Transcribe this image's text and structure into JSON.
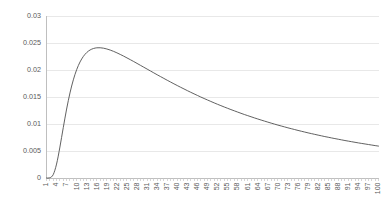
{
  "chart_data": {
    "type": "line",
    "title": "",
    "subtitle": "",
    "xlabel": "",
    "ylabel": "",
    "xlim": [
      1,
      100
    ],
    "ylim": [
      0,
      0.03
    ],
    "grid": true,
    "legend": null,
    "legend_position": "none",
    "series_color": "#4f4f4f",
    "grid_color": "#e2e2e2",
    "axis_color": "#b8b8b8",
    "tick_label_color": "#5a5a5a",
    "y_ticks": [
      {
        "value": 0,
        "label": "0"
      },
      {
        "value": 0.005,
        "label": "0.005"
      },
      {
        "value": 0.01,
        "label": "0.01"
      },
      {
        "value": 0.015,
        "label": "0.015"
      },
      {
        "value": 0.02,
        "label": "0.02"
      },
      {
        "value": 0.025,
        "label": "0.025"
      },
      {
        "value": 0.03,
        "label": "0.03"
      }
    ],
    "x_ticks": [
      {
        "value": 1,
        "label": "1"
      },
      {
        "value": 4,
        "label": "4"
      },
      {
        "value": 7,
        "label": "7"
      },
      {
        "value": 10,
        "label": "10"
      },
      {
        "value": 13,
        "label": "13"
      },
      {
        "value": 16,
        "label": "16"
      },
      {
        "value": 19,
        "label": "19"
      },
      {
        "value": 22,
        "label": "22"
      },
      {
        "value": 25,
        "label": "25"
      },
      {
        "value": 28,
        "label": "28"
      },
      {
        "value": 31,
        "label": "31"
      },
      {
        "value": 34,
        "label": "34"
      },
      {
        "value": 37,
        "label": "37"
      },
      {
        "value": 40,
        "label": "40"
      },
      {
        "value": 43,
        "label": "43"
      },
      {
        "value": 46,
        "label": "46"
      },
      {
        "value": 49,
        "label": "49"
      },
      {
        "value": 52,
        "label": "52"
      },
      {
        "value": 55,
        "label": "55"
      },
      {
        "value": 58,
        "label": "58"
      },
      {
        "value": 61,
        "label": "61"
      },
      {
        "value": 64,
        "label": "64"
      },
      {
        "value": 67,
        "label": "67"
      },
      {
        "value": 70,
        "label": "70"
      },
      {
        "value": 73,
        "label": "73"
      },
      {
        "value": 76,
        "label": "76"
      },
      {
        "value": 79,
        "label": "79"
      },
      {
        "value": 82,
        "label": "82"
      },
      {
        "value": 85,
        "label": "85"
      },
      {
        "value": 88,
        "label": "88"
      },
      {
        "value": 91,
        "label": "91"
      },
      {
        "value": 94,
        "label": "94"
      },
      {
        "value": 97,
        "label": "97"
      },
      {
        "value": 100,
        "label": "100"
      }
    ],
    "x": [
      1,
      2,
      3,
      4,
      5,
      6,
      7,
      8,
      9,
      10,
      11,
      12,
      13,
      14,
      15,
      16,
      17,
      18,
      19,
      20,
      21,
      22,
      23,
      24,
      25,
      26,
      27,
      28,
      29,
      30,
      31,
      32,
      33,
      34,
      35,
      36,
      37,
      38,
      39,
      40,
      41,
      42,
      43,
      44,
      45,
      46,
      47,
      48,
      49,
      50,
      51,
      52,
      53,
      54,
      55,
      56,
      57,
      58,
      59,
      60,
      61,
      62,
      63,
      64,
      65,
      66,
      67,
      68,
      69,
      70,
      71,
      72,
      73,
      74,
      75,
      76,
      77,
      78,
      79,
      80,
      81,
      82,
      83,
      84,
      85,
      86,
      87,
      88,
      89,
      90,
      91,
      92,
      93,
      94,
      95,
      96,
      97,
      98,
      99,
      100
    ],
    "values": [
      0.0,
      4e-05,
      0.00062,
      0.00258,
      0.00573,
      0.00933,
      0.01277,
      0.01575,
      0.01818,
      0.02007,
      0.02149,
      0.02252,
      0.02324,
      0.02371,
      0.02398,
      0.02411,
      0.02412,
      0.02404,
      0.02389,
      0.02369,
      0.02345,
      0.02318,
      0.02288,
      0.02257,
      0.02224,
      0.02191,
      0.02157,
      0.02122,
      0.02087,
      0.02052,
      0.02017,
      0.01982,
      0.01947,
      0.01912,
      0.01878,
      0.01844,
      0.0181,
      0.01777,
      0.01744,
      0.01712,
      0.0168,
      0.01649,
      0.01618,
      0.01588,
      0.01558,
      0.01529,
      0.015,
      0.01472,
      0.01445,
      0.01418,
      0.01391,
      0.01365,
      0.0134,
      0.01315,
      0.01291,
      0.01267,
      0.01244,
      0.01221,
      0.01198,
      0.01176,
      0.01155,
      0.01134,
      0.01113,
      0.01093,
      0.01073,
      0.01054,
      0.01035,
      0.01016,
      0.00998,
      0.0098,
      0.00963,
      0.00946,
      0.00929,
      0.00913,
      0.00897,
      0.00881,
      0.00866,
      0.00851,
      0.00836,
      0.00822,
      0.00808,
      0.00794,
      0.00781,
      0.00767,
      0.00755,
      0.00742,
      0.0073,
      0.00718,
      0.00706,
      0.00694,
      0.00683,
      0.00672,
      0.00661,
      0.0065,
      0.0064,
      0.0063,
      0.0062,
      0.0061,
      0.006,
      0.00591
    ]
  }
}
